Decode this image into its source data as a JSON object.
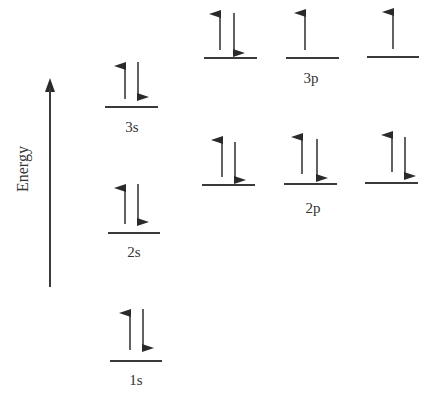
{
  "top_cut_text": "ergy diagram, …",
  "axis": {
    "label": "Energy",
    "direction": "up"
  },
  "orbitals": {
    "s": [
      {
        "name": "1s",
        "label": "1s",
        "electrons": [
          "up",
          "down"
        ]
      },
      {
        "name": "2s",
        "label": "2s",
        "electrons": [
          "up",
          "down"
        ]
      },
      {
        "name": "3s",
        "label": "3s",
        "electrons": [
          "up",
          "down"
        ]
      }
    ],
    "p2": {
      "label": "2p",
      "boxes": [
        {
          "electrons": [
            "up",
            "down"
          ]
        },
        {
          "electrons": [
            "up",
            "down"
          ]
        },
        {
          "electrons": [
            "up",
            "down"
          ]
        }
      ]
    },
    "p3": {
      "label": "3p",
      "boxes": [
        {
          "electrons": [
            "up",
            "down"
          ]
        },
        {
          "electrons": [
            "up"
          ]
        },
        {
          "electrons": [
            "up"
          ]
        }
      ]
    }
  },
  "electron_configuration": "1s2 2s2 2p6 3s2 3p4",
  "colors": {
    "line": "#3a3a3a",
    "text": "#333333",
    "background": "#ffffff"
  }
}
